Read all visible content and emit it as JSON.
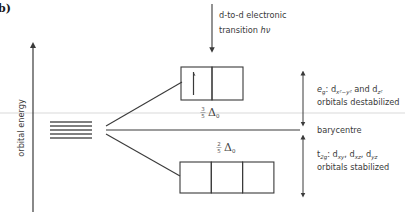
{
  "panel_label": "b)",
  "axis": {
    "label": "orbital energy"
  },
  "transition": {
    "line1": "d-to-d electronic",
    "line2_prefix": "transition ",
    "line2_symbol": "hν"
  },
  "eg": {
    "symbol": "e",
    "symbol_sub": "g",
    "text_a": ": d",
    "sub_a": "x²−y²",
    "text_b": " and d",
    "sub_b": "z²",
    "line2": "orbitals destabilized"
  },
  "barycentre": "barycentre",
  "t2g": {
    "symbol": "t",
    "symbol_sub": "2g",
    "text_a": ": d",
    "sub_a": "xy",
    "text_b": ", d",
    "sub_b": "xz",
    "text_c": ", d",
    "sub_c": "yz",
    "line2": "orbitals stabilized"
  },
  "upper_split": {
    "num": "3",
    "den": "5",
    "symbol": "Δ",
    "sub": "0"
  },
  "lower_split": {
    "num": "2",
    "den": "5",
    "symbol": "Δ",
    "sub": "0"
  },
  "eg_orbitals": {
    "count": 2,
    "electrons": [
      "up",
      ""
    ]
  },
  "t2g_orbitals": {
    "count": 3,
    "electrons": [
      "",
      "",
      ""
    ]
  },
  "degenerate_levels": 5,
  "colors": {
    "line": "#3a3a3a",
    "guide": "#d8d8d8",
    "text": "#3a3a3a"
  }
}
